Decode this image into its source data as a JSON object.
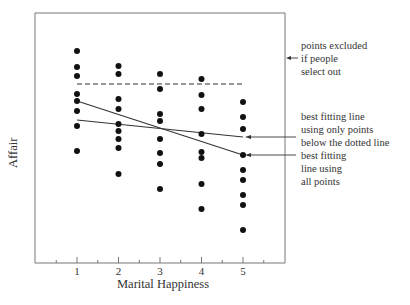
{
  "chart_data": {
    "type": "scatter",
    "title": "",
    "xlabel": "Marital Happiness",
    "ylabel": "Affair",
    "x_ticks": [
      "1",
      "2",
      "3",
      "4",
      "5"
    ],
    "xlim": [
      0.5,
      5.5
    ],
    "y_ticks": [],
    "grid": false,
    "points_pixel_y": {
      "1": [
        51,
        67,
        76,
        94,
        101,
        111,
        126,
        151
      ],
      "2": [
        66,
        74,
        99,
        109,
        124,
        131,
        139,
        148,
        174
      ],
      "3": [
        74,
        89,
        114,
        121,
        139,
        153,
        164,
        189
      ],
      "4": [
        79,
        95,
        109,
        134,
        152,
        158,
        184,
        209
      ],
      "5": [
        102,
        117,
        129,
        155,
        170,
        180,
        195,
        205,
        230
      ]
    },
    "reference_lines": [
      {
        "name": "selection cutoff",
        "style": "dashed",
        "orientation": "horizontal"
      },
      {
        "name": "best fitting line using all points",
        "style": "solid",
        "slope": "negative, steeper"
      },
      {
        "name": "best fitting line using only points below the dotted line",
        "style": "solid",
        "slope": "negative, flatter"
      }
    ],
    "annotations": [
      "points excluded if people select out",
      "best fitting line using only points below the dotted line",
      "best fitting line using all points"
    ]
  },
  "axes": {
    "xlabel": "Marital Happiness",
    "ylabel": "Affair",
    "ticks": [
      "1",
      "2",
      "3",
      "4",
      "5"
    ]
  },
  "annotations": {
    "excluded": [
      "points excluded",
      "if people",
      "select out"
    ],
    "below_line": [
      "best fitting line",
      "using only points",
      "below the dotted line"
    ],
    "all_line": [
      "best fitting",
      "line using",
      "all points"
    ]
  }
}
